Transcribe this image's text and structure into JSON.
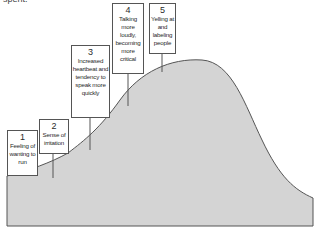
{
  "caption": "spent.",
  "steps": [
    {
      "number": "1",
      "text": "Feeling of wanting to run"
    },
    {
      "number": "2",
      "text": "Sense of irritation"
    },
    {
      "number": "3",
      "text": "Increased heartbeat and tendency to speak more quickly"
    },
    {
      "number": "4",
      "text": "Talking more loudly, becoming more critical"
    },
    {
      "number": "5",
      "text": "Yelling at and labeling people"
    }
  ],
  "colors": {
    "fill": "#d4d4d4",
    "stroke": "#555555"
  }
}
